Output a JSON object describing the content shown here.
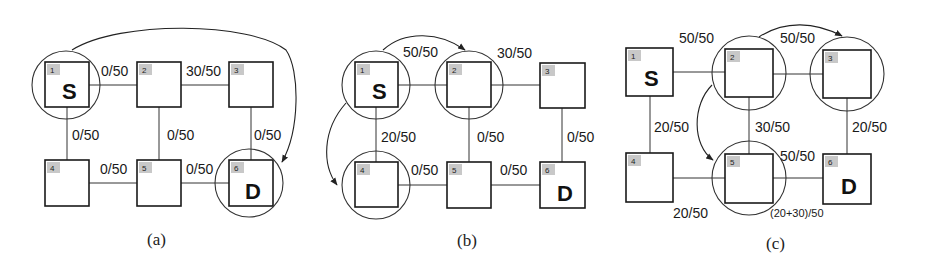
{
  "figure": {
    "panels": [
      {
        "id": "a",
        "caption": "(a)",
        "nodes": [
          {
            "num": "1",
            "label": "S"
          },
          {
            "num": "2",
            "label": ""
          },
          {
            "num": "3",
            "label": ""
          },
          {
            "num": "4",
            "label": ""
          },
          {
            "num": "5",
            "label": ""
          },
          {
            "num": "6",
            "label": "D"
          }
        ],
        "edges": {
          "e12": "0/50",
          "e23": "30/50",
          "e14": "0/50",
          "e25": "0/50",
          "e36": "0/50",
          "e45": "0/50",
          "e56": "0/50"
        },
        "highlighted_nodes": [
          "1",
          "6"
        ],
        "arrows": [
          {
            "from": "1",
            "to": "6"
          }
        ]
      },
      {
        "id": "b",
        "caption": "(b)",
        "nodes": [
          {
            "num": "1",
            "label": "S"
          },
          {
            "num": "2",
            "label": ""
          },
          {
            "num": "3",
            "label": ""
          },
          {
            "num": "4",
            "label": ""
          },
          {
            "num": "5",
            "label": ""
          },
          {
            "num": "6",
            "label": "D"
          }
        ],
        "edges": {
          "e12": "50/50",
          "e23": "30/50",
          "e14": "20/50",
          "e25": "0/50",
          "e36": "0/50",
          "e45": "0/50",
          "e56": "0/50"
        },
        "highlighted_nodes": [
          "1",
          "2",
          "4"
        ],
        "arrows": [
          {
            "from": "1",
            "to": "2"
          },
          {
            "from": "1",
            "to": "4"
          }
        ]
      },
      {
        "id": "c",
        "caption": "(c)",
        "nodes": [
          {
            "num": "1",
            "label": "S"
          },
          {
            "num": "2",
            "label": ""
          },
          {
            "num": "3",
            "label": ""
          },
          {
            "num": "4",
            "label": ""
          },
          {
            "num": "5",
            "label": ""
          },
          {
            "num": "6",
            "label": "D"
          }
        ],
        "edges": {
          "e12": "50/50",
          "e23": "50/50",
          "e14": "20/50",
          "e25": "30/50",
          "e36": "20/50",
          "e45": "20/50",
          "e56": "(20+30)/50",
          "e56_top": "50/50"
        },
        "highlighted_nodes": [
          "2",
          "3",
          "5"
        ],
        "arrows": [
          {
            "from": "2",
            "to": "3"
          },
          {
            "from": "2",
            "to": "5"
          }
        ]
      }
    ]
  }
}
